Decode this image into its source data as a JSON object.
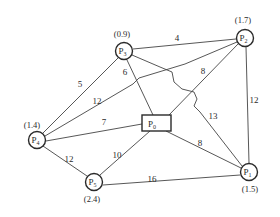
{
  "diagram": {
    "type": "weighted-graph",
    "nodes": [
      {
        "id": "P0",
        "label": "P",
        "sub": "0",
        "shape": "rect",
        "value": null
      },
      {
        "id": "P1",
        "label": "P",
        "sub": "1",
        "shape": "circle",
        "value": "(1.5)"
      },
      {
        "id": "P2",
        "label": "P",
        "sub": "2",
        "shape": "circle",
        "value": "(1.7)"
      },
      {
        "id": "P3",
        "label": "P",
        "sub": "3",
        "shape": "circle",
        "value": "(0.9)"
      },
      {
        "id": "P4",
        "label": "P",
        "sub": "4",
        "shape": "circle",
        "value": "(1.4)"
      },
      {
        "id": "P5",
        "label": "P",
        "sub": "5",
        "shape": "circle",
        "value": "(2.4)"
      }
    ],
    "edges": [
      {
        "from": "P3",
        "to": "P2",
        "weight": "4"
      },
      {
        "from": "P3",
        "to": "P4",
        "weight": "5"
      },
      {
        "from": "P3",
        "to": "P0",
        "weight": "6"
      },
      {
        "from": "P2",
        "to": "P0",
        "weight": "8"
      },
      {
        "from": "P4",
        "to": "P2",
        "weight": "12"
      },
      {
        "from": "P2",
        "to": "P1",
        "weight": "12"
      },
      {
        "from": "P4",
        "to": "P0",
        "weight": "7"
      },
      {
        "from": "P3",
        "to": "P1",
        "weight": "13"
      },
      {
        "from": "P4",
        "to": "P5",
        "weight": "12"
      },
      {
        "from": "P5",
        "to": "P0",
        "weight": "10"
      },
      {
        "from": "P0",
        "to": "P1",
        "weight": "8"
      },
      {
        "from": "P5",
        "to": "P1",
        "weight": "16"
      }
    ]
  }
}
